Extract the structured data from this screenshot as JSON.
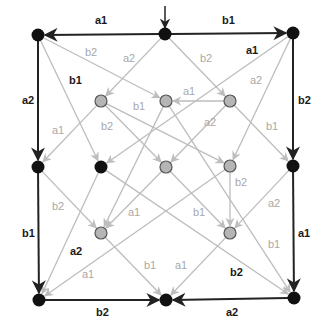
{
  "diagram": {
    "type": "directed-graph",
    "colors": {
      "dark_edge": "#222222",
      "light_edge": "#bdbdbd",
      "black_node": "#111111",
      "gray_node_fill": "#b5b5b5",
      "gray_node_stroke": "#555555"
    },
    "start_arrow": {
      "x": 165,
      "y1": 6,
      "y2": 28
    },
    "nodes": [
      {
        "id": "n0",
        "x": 38,
        "y": 35,
        "kind": "black"
      },
      {
        "id": "n1",
        "x": 165,
        "y": 34,
        "kind": "black"
      },
      {
        "id": "n2",
        "x": 293,
        "y": 33,
        "kind": "black"
      },
      {
        "id": "g1",
        "x": 101,
        "y": 101,
        "kind": "gray"
      },
      {
        "id": "g2",
        "x": 166,
        "y": 101,
        "kind": "gray"
      },
      {
        "id": "g3",
        "x": 230,
        "y": 101,
        "kind": "gray"
      },
      {
        "id": "n3",
        "x": 38,
        "y": 167,
        "kind": "black"
      },
      {
        "id": "n4",
        "x": 101,
        "y": 167,
        "kind": "black"
      },
      {
        "id": "g4",
        "x": 166,
        "y": 167,
        "kind": "gray"
      },
      {
        "id": "g5",
        "x": 230,
        "y": 166,
        "kind": "gray"
      },
      {
        "id": "n5",
        "x": 293,
        "y": 166,
        "kind": "black"
      },
      {
        "id": "g6",
        "x": 101,
        "y": 233,
        "kind": "gray"
      },
      {
        "id": "g7",
        "x": 230,
        "y": 233,
        "kind": "gray"
      },
      {
        "id": "n6",
        "x": 39,
        "y": 300,
        "kind": "black"
      },
      {
        "id": "n7",
        "x": 166,
        "y": 300,
        "kind": "black"
      },
      {
        "id": "n8",
        "x": 294,
        "y": 298,
        "kind": "black"
      }
    ],
    "edges": [
      {
        "from": "n1",
        "to": "n0",
        "label": "a1",
        "style": "dark",
        "lx": 95,
        "ly": 24
      },
      {
        "from": "n1",
        "to": "n2",
        "label": "b1",
        "style": "dark",
        "lx": 222,
        "ly": 24
      },
      {
        "from": "n0",
        "to": "n3",
        "label": "a2",
        "style": "dark",
        "lx": 22,
        "ly": 104
      },
      {
        "from": "n2",
        "to": "n5",
        "label": "b2",
        "style": "dark",
        "lx": 298,
        "ly": 104
      },
      {
        "from": "n3",
        "to": "n6",
        "label": "b1",
        "style": "dark",
        "lx": 22,
        "ly": 237
      },
      {
        "from": "n5",
        "to": "n8",
        "label": "a1",
        "style": "dark",
        "lx": 298,
        "ly": 237
      },
      {
        "from": "n6",
        "to": "n7",
        "label": "b2",
        "style": "dark",
        "lx": 96,
        "ly": 316
      },
      {
        "from": "n8",
        "to": "n7",
        "label": "a2",
        "style": "dark",
        "lx": 226,
        "ly": 316
      },
      {
        "from": "n0",
        "to": "n4",
        "label": "b1",
        "style": "light",
        "label_style": "dark",
        "lx": 69,
        "ly": 84
      },
      {
        "from": "n2",
        "to": "n4",
        "label": "a1",
        "style": "light",
        "label_style": "dark",
        "lx": 246,
        "ly": 54
      },
      {
        "from": "n4",
        "to": "n6",
        "label": "a2",
        "style": "light",
        "label_style": "dark",
        "lx": 70,
        "ly": 255
      },
      {
        "from": "n4",
        "to": "n8",
        "label": "b2",
        "style": "light",
        "label_style": "dark",
        "lx": 230,
        "ly": 276
      },
      {
        "from": "n1",
        "to": "g1",
        "label": "a2",
        "style": "light",
        "lx": 123,
        "ly": 62
      },
      {
        "from": "n1",
        "to": "g3",
        "label": "b2",
        "style": "light",
        "lx": 200,
        "ly": 62
      },
      {
        "from": "n0",
        "to": "g2",
        "label": "b2",
        "style": "light",
        "lx": 85,
        "ly": 56
      },
      {
        "from": "n2",
        "to": "g5",
        "label": "a2",
        "style": "light",
        "lx": 250,
        "ly": 84
      },
      {
        "from": "g3",
        "to": "g2",
        "label": "a1",
        "style": "light",
        "lx": 183,
        "ly": 95
      },
      {
        "from": "g3",
        "to": "g4",
        "label": "a2",
        "style": "light",
        "lx": 204,
        "ly": 126
      },
      {
        "from": "g3",
        "to": "n5",
        "label": "b1",
        "style": "light",
        "lx": 266,
        "ly": 130
      },
      {
        "from": "g1",
        "to": "n3",
        "label": "a1",
        "style": "light",
        "lx": 52,
        "ly": 134
      },
      {
        "from": "g1",
        "to": "g4",
        "label": "b2",
        "style": "light",
        "lx": 101,
        "ly": 130
      },
      {
        "from": "g1",
        "to": "g5",
        "label": "b1",
        "style": "light",
        "lx": 133,
        "ly": 110
      },
      {
        "from": "g2",
        "to": "g6",
        "label": "",
        "style": "light"
      },
      {
        "from": "g2",
        "to": "n8",
        "label": "",
        "style": "light"
      },
      {
        "from": "n3",
        "to": "g6",
        "label": "b2",
        "style": "light",
        "lx": 52,
        "ly": 210
      },
      {
        "from": "g4",
        "to": "g6",
        "label": "a1",
        "style": "light",
        "lx": 128,
        "ly": 216
      },
      {
        "from": "g4",
        "to": "g7",
        "label": "b1",
        "style": "light",
        "lx": 193,
        "ly": 216
      },
      {
        "from": "g5",
        "to": "g7",
        "label": "b2",
        "style": "light",
        "lx": 235,
        "ly": 186
      },
      {
        "from": "g5",
        "to": "n6",
        "label": "a1",
        "style": "light",
        "lx": 82,
        "ly": 278
      },
      {
        "from": "n5",
        "to": "g7",
        "label": "a2",
        "style": "light",
        "lx": 268,
        "ly": 207
      },
      {
        "from": "g6",
        "to": "n7",
        "label": "b1",
        "style": "light",
        "lx": 144,
        "ly": 269
      },
      {
        "from": "g7",
        "to": "n7",
        "label": "a1",
        "style": "light",
        "lx": 175,
        "ly": 269
      },
      {
        "from": "n8",
        "to": "g7",
        "label": "b1",
        "style": "light",
        "lx": 268,
        "ly": 248,
        "skip_line": true
      }
    ]
  }
}
